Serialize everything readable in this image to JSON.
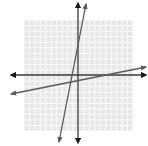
{
  "figure": {
    "width": 148,
    "height": 146
  },
  "grid": {
    "x0": 24,
    "y0": 20,
    "x1": 133,
    "y1": 131,
    "cells_x": 20,
    "cells_y": 20,
    "color": "#cfcfcf",
    "background": "#e8e8e8"
  },
  "axes": {
    "color": "#3a3a3a",
    "x_axis": {
      "y": 75,
      "x_start": 11,
      "x_end": 146
    },
    "y_axis": {
      "x": 78,
      "y_start": 3,
      "y_end": 143
    }
  },
  "lines": [
    {
      "name": "steep-line",
      "x1": 86,
      "y1": 4,
      "x2": 59,
      "y2": 142,
      "color": "#5a5a5a"
    },
    {
      "name": "shallow-line",
      "x1": 11,
      "y1": 94,
      "x2": 146,
      "y2": 67,
      "color": "#5a5a5a"
    }
  ]
}
